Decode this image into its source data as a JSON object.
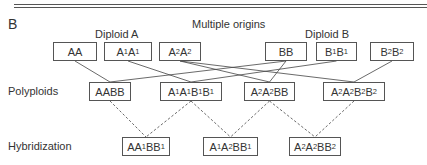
{
  "panel_label": "B",
  "title": "Multiple origins",
  "groups": {
    "diploid_a": "Diploid A",
    "diploid_b": "Diploid B"
  },
  "row_labels": {
    "polyploids": "Polyploids",
    "hybridization": "Hybridization"
  },
  "diploids": [
    {
      "id": "AA",
      "parts": [
        [
          "A",
          ""
        ],
        [
          "A",
          ""
        ]
      ],
      "x": 53,
      "y": 42,
      "w": 44
    },
    {
      "id": "A1A1",
      "parts": [
        [
          "A",
          "1"
        ],
        [
          "A",
          "1"
        ]
      ],
      "x": 104,
      "y": 42,
      "w": 48
    },
    {
      "id": "A2A2",
      "parts": [
        [
          "A",
          "2"
        ],
        [
          "A",
          "2"
        ]
      ],
      "x": 159,
      "y": 42,
      "w": 42
    },
    {
      "id": "BB",
      "parts": [
        [
          "B",
          ""
        ],
        [
          "B",
          ""
        ]
      ],
      "x": 265,
      "y": 42,
      "w": 42
    },
    {
      "id": "B1B1",
      "parts": [
        [
          "B",
          "1"
        ],
        [
          "B",
          "1"
        ]
      ],
      "x": 316,
      "y": 42,
      "w": 41
    },
    {
      "id": "B2B2",
      "parts": [
        [
          "B",
          "2"
        ],
        [
          "B",
          "2"
        ]
      ],
      "x": 370,
      "y": 42,
      "w": 44
    }
  ],
  "polyploids": [
    {
      "id": "AABB",
      "parts": [
        [
          "A",
          ""
        ],
        [
          "A",
          ""
        ],
        [
          "B",
          ""
        ],
        [
          "B",
          ""
        ]
      ],
      "x": 89,
      "y": 82,
      "w": 42
    },
    {
      "id": "A1A1B1B1",
      "parts": [
        [
          "A",
          "1"
        ],
        [
          "A",
          "1"
        ],
        [
          "B",
          "1"
        ],
        [
          "B",
          "1"
        ]
      ],
      "x": 160,
      "y": 82,
      "w": 62
    },
    {
      "id": "A2A2BB",
      "parts": [
        [
          "A",
          "2"
        ],
        [
          "A",
          "2"
        ],
        [
          "B",
          ""
        ],
        [
          "B",
          ""
        ]
      ],
      "x": 244,
      "y": 82,
      "w": 51
    },
    {
      "id": "A2A2B2B2",
      "parts": [
        [
          "A",
          "2"
        ],
        [
          "A",
          "2"
        ],
        [
          "B",
          "2"
        ],
        [
          "B",
          "2"
        ]
      ],
      "x": 323,
      "y": 82,
      "w": 62
    }
  ],
  "hybrids": [
    {
      "id": "AA1BB1",
      "parts": [
        [
          "A",
          ""
        ],
        [
          "A",
          "1"
        ],
        [
          "B",
          ""
        ],
        [
          "B",
          "1"
        ]
      ],
      "x": 122,
      "y": 137,
      "w": 48
    },
    {
      "id": "A1A2BB1",
      "parts": [
        [
          "A",
          "1"
        ],
        [
          "A",
          "2"
        ],
        [
          "B",
          ""
        ],
        [
          "B",
          "1"
        ]
      ],
      "x": 203,
      "y": 137,
      "w": 55
    },
    {
      "id": "A2A2BB2",
      "parts": [
        [
          "A",
          "2"
        ],
        [
          "A",
          "2"
        ],
        [
          "B",
          ""
        ],
        [
          "B",
          "2"
        ]
      ],
      "x": 289,
      "y": 137,
      "w": 52
    }
  ],
  "solid_edges": [
    [
      "AA",
      "AABB"
    ],
    [
      "A1A1",
      "A1A1B1B1"
    ],
    [
      "A2A2",
      "A2A2BB"
    ],
    [
      "A2A2",
      "A2A2B2B2"
    ],
    [
      "BB",
      "A2A2BB"
    ],
    [
      "BB",
      "AABB"
    ],
    [
      "B1B1",
      "A1A1B1B1"
    ],
    [
      "B2B2",
      "A2A2B2B2"
    ]
  ],
  "dashed_edges": [
    [
      "AABB",
      "AA1BB1"
    ],
    [
      "A1A1B1B1",
      "AA1BB1"
    ],
    [
      "A1A1B1B1",
      "A1A2BB1"
    ],
    [
      "A2A2BB",
      "A1A2BB1"
    ],
    [
      "A2A2BB",
      "A2A2BB2"
    ],
    [
      "A2A2B2B2",
      "A2A2BB2"
    ]
  ],
  "colors": {
    "line": "#444444",
    "box_border": "#555555",
    "text": "#333333"
  }
}
